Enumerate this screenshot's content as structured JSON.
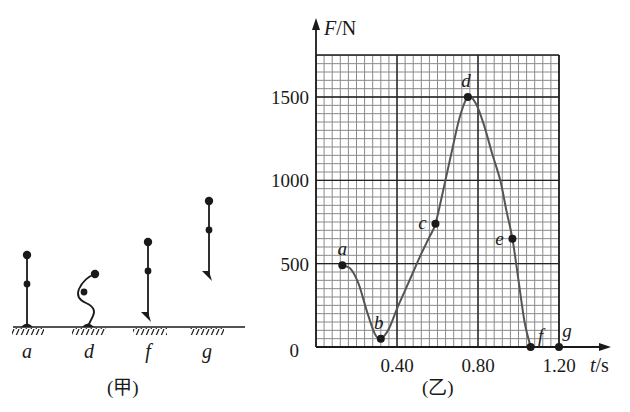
{
  "left_figure": {
    "caption": "(甲)",
    "figures": [
      {
        "label": "a",
        "pose": "standing"
      },
      {
        "label": "d",
        "pose": "crouching"
      },
      {
        "label": "f",
        "pose": "leaving-ground"
      },
      {
        "label": "g",
        "pose": "airborne"
      }
    ]
  },
  "right_figure": {
    "caption": "(乙)"
  },
  "chart_data": {
    "type": "line",
    "title": "",
    "xlabel": "t/s",
    "ylabel": "F/N",
    "x_ticks": [
      "0.40",
      "0.80",
      "1.20"
    ],
    "x_tick_values": [
      0.4,
      0.8,
      1.2
    ],
    "y_ticks": [
      "0",
      "500",
      "1000",
      "1500"
    ],
    "y_tick_values": [
      0,
      500,
      1000,
      1500
    ],
    "origin_label": "0",
    "xlim": [
      0,
      1.2
    ],
    "ylim": [
      0,
      1750
    ],
    "grid": true,
    "grid_minor": {
      "x_step": 0.04,
      "y_step": 50
    },
    "grid_major": {
      "x_step": 0.4,
      "y_step": 500
    },
    "points": [
      {
        "label": "a",
        "t": 0.13,
        "F": 490
      },
      {
        "label": "b",
        "t": 0.32,
        "F": 50
      },
      {
        "label": "c",
        "t": 0.59,
        "F": 740
      },
      {
        "label": "d",
        "t": 0.75,
        "F": 1500
      },
      {
        "label": "e",
        "t": 0.97,
        "F": 650
      },
      {
        "label": "f",
        "t": 1.06,
        "F": 0
      },
      {
        "label": "g",
        "t": 1.2,
        "F": 0
      }
    ],
    "curve": [
      [
        0.13,
        490
      ],
      [
        0.17,
        470
      ],
      [
        0.21,
        380
      ],
      [
        0.25,
        220
      ],
      [
        0.29,
        80
      ],
      [
        0.32,
        50
      ],
      [
        0.36,
        110
      ],
      [
        0.4,
        230
      ],
      [
        0.44,
        340
      ],
      [
        0.48,
        450
      ],
      [
        0.52,
        560
      ],
      [
        0.56,
        660
      ],
      [
        0.59,
        740
      ],
      [
        0.63,
        950
      ],
      [
        0.67,
        1170
      ],
      [
        0.71,
        1380
      ],
      [
        0.75,
        1500
      ],
      [
        0.79,
        1460
      ],
      [
        0.83,
        1330
      ],
      [
        0.87,
        1160
      ],
      [
        0.91,
        1000
      ],
      [
        0.94,
        820
      ],
      [
        0.97,
        650
      ],
      [
        1.0,
        400
      ],
      [
        1.03,
        150
      ],
      [
        1.06,
        0
      ]
    ]
  }
}
